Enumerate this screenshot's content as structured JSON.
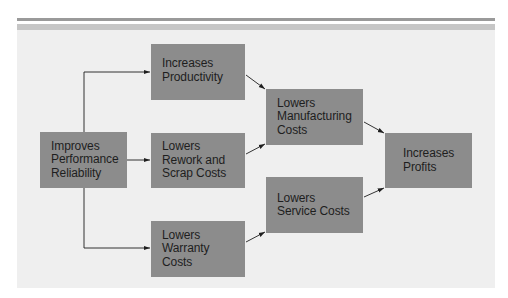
{
  "diagram": {
    "type": "flowchart",
    "direction": "left-to-right",
    "colors": {
      "background": "#ffffff",
      "panel": "#efefef",
      "box_fill": "#8c8c8c",
      "text": "#1e1e1e",
      "arrow": "#1e1e1e",
      "rule_dark": "#9a9a9a",
      "rule_light": "#c6c6c6"
    },
    "nodes": [
      {
        "id": "performance",
        "label": "Improves\nPerformance\nReliability"
      },
      {
        "id": "productivity",
        "label": "Increases\nProductivity"
      },
      {
        "id": "rework",
        "label": "Lowers\nRework and\nScrap Costs"
      },
      {
        "id": "warranty",
        "label": "Lowers\nWarranty\nCosts"
      },
      {
        "id": "manufacturing",
        "label": "Lowers\nManufacturing\nCosts"
      },
      {
        "id": "service",
        "label": "Lowers\nService Costs"
      },
      {
        "id": "profits",
        "label": "Increases\nProfits"
      }
    ],
    "edges": [
      {
        "from": "performance",
        "to": "productivity"
      },
      {
        "from": "performance",
        "to": "rework"
      },
      {
        "from": "performance",
        "to": "warranty"
      },
      {
        "from": "productivity",
        "to": "manufacturing"
      },
      {
        "from": "rework",
        "to": "manufacturing"
      },
      {
        "from": "warranty",
        "to": "service"
      },
      {
        "from": "manufacturing",
        "to": "profits"
      },
      {
        "from": "service",
        "to": "profits"
      }
    ]
  }
}
